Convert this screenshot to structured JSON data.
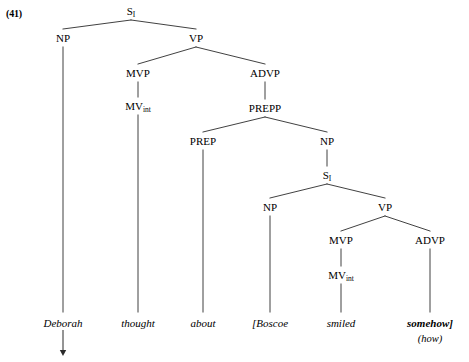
{
  "figure": {
    "example_number": "(41)",
    "background_color": "#ffffff",
    "line_color": "#2b2b2b",
    "text_color": "#000000"
  },
  "tree": {
    "nodes": [
      {
        "id": "s-root",
        "label": "S",
        "subscript": "I",
        "x": 131,
        "y": 6
      },
      {
        "id": "np-matrix",
        "label": "NP",
        "subscript": "",
        "x": 63,
        "y": 33
      },
      {
        "id": "vp-matrix",
        "label": "VP",
        "subscript": "",
        "x": 196,
        "y": 33
      },
      {
        "id": "mvp-matrix",
        "label": "MVP",
        "subscript": "",
        "x": 138,
        "y": 68
      },
      {
        "id": "advp-matrix",
        "label": "ADVP",
        "subscript": "",
        "x": 265,
        "y": 68
      },
      {
        "id": "mvint-matrix",
        "label": "MV",
        "subscript": "int",
        "x": 138,
        "y": 101
      },
      {
        "id": "prepp",
        "label": "PREPP",
        "subscript": "",
        "x": 265,
        "y": 103
      },
      {
        "id": "prep",
        "label": "PREP",
        "subscript": "",
        "x": 203,
        "y": 136
      },
      {
        "id": "np-embed-top",
        "label": "NP",
        "subscript": "",
        "x": 327,
        "y": 136
      },
      {
        "id": "s-embed",
        "label": "S",
        "subscript": "I",
        "x": 327,
        "y": 170
      },
      {
        "id": "np-embed",
        "label": "NP",
        "subscript": "",
        "x": 270,
        "y": 202
      },
      {
        "id": "vp-embed",
        "label": "VP",
        "subscript": "",
        "x": 385,
        "y": 202
      },
      {
        "id": "mvp-embed",
        "label": "MVP",
        "subscript": "",
        "x": 341,
        "y": 235
      },
      {
        "id": "advp-embed",
        "label": "ADVP",
        "subscript": "",
        "x": 430,
        "y": 235
      },
      {
        "id": "mvint-embed",
        "label": "MV",
        "subscript": "int",
        "x": 341,
        "y": 270
      }
    ],
    "edges": [
      {
        "id": "e-root-np",
        "x1": 131,
        "y1": 20,
        "x2": 63,
        "y2": 29
      },
      {
        "id": "e-root-vp",
        "x1": 131,
        "y1": 20,
        "x2": 196,
        "y2": 29
      },
      {
        "id": "e-vp-mvp",
        "x1": 196,
        "y1": 47,
        "x2": 138,
        "y2": 64
      },
      {
        "id": "e-vp-advp",
        "x1": 196,
        "y1": 47,
        "x2": 265,
        "y2": 64
      },
      {
        "id": "e-mvp-mvint",
        "x1": 138,
        "y1": 82,
        "x2": 138,
        "y2": 97
      },
      {
        "id": "e-advp-prepp",
        "x1": 265,
        "y1": 82,
        "x2": 265,
        "y2": 99
      },
      {
        "id": "e-prepp-prep",
        "x1": 265,
        "y1": 117,
        "x2": 203,
        "y2": 132
      },
      {
        "id": "e-prepp-np",
        "x1": 265,
        "y1": 117,
        "x2": 327,
        "y2": 132
      },
      {
        "id": "e-np-sembed",
        "x1": 327,
        "y1": 150,
        "x2": 327,
        "y2": 166
      },
      {
        "id": "e-sembed-np",
        "x1": 327,
        "y1": 184,
        "x2": 270,
        "y2": 198
      },
      {
        "id": "e-sembed-vp",
        "x1": 327,
        "y1": 184,
        "x2": 385,
        "y2": 198
      },
      {
        "id": "e-vpembed-mvp",
        "x1": 385,
        "y1": 216,
        "x2": 341,
        "y2": 231
      },
      {
        "id": "e-vpembed-advp",
        "x1": 385,
        "y1": 216,
        "x2": 430,
        "y2": 231
      },
      {
        "id": "e-mvpembed-mvint",
        "x1": 341,
        "y1": 249,
        "x2": 341,
        "y2": 266
      },
      {
        "id": "e-np-deborah",
        "x1": 63,
        "y1": 47,
        "x2": 63,
        "y2": 312
      },
      {
        "id": "e-mvint-thought",
        "x1": 138,
        "y1": 115,
        "x2": 138,
        "y2": 312
      },
      {
        "id": "e-prep-about",
        "x1": 203,
        "y1": 150,
        "x2": 203,
        "y2": 312
      },
      {
        "id": "e-npembed-boscoe",
        "x1": 270,
        "y1": 216,
        "x2": 270,
        "y2": 312
      },
      {
        "id": "e-mvint-smiled",
        "x1": 341,
        "y1": 284,
        "x2": 341,
        "y2": 312
      },
      {
        "id": "e-advp-somehow",
        "x1": 430,
        "y1": 249,
        "x2": 430,
        "y2": 312
      }
    ],
    "terminals": [
      {
        "id": "t-deborah",
        "text": "Deborah",
        "x": 63,
        "y": 318,
        "bold": false
      },
      {
        "id": "t-thought",
        "text": "thought",
        "x": 138,
        "y": 318,
        "bold": false
      },
      {
        "id": "t-about",
        "text": "about",
        "x": 203,
        "y": 318,
        "bold": false
      },
      {
        "id": "t-boscoe",
        "text": "[Boscoe",
        "x": 270,
        "y": 318,
        "bold": false
      },
      {
        "id": "t-smiled",
        "text": "smiled",
        "x": 341,
        "y": 318,
        "bold": false
      },
      {
        "id": "t-somehow",
        "text": "somehow]",
        "x": 430,
        "y": 318,
        "bold": true
      }
    ],
    "gloss": {
      "id": "gloss-how",
      "text": "(how)",
      "x": 430,
      "y": 334
    },
    "movement_arrow": {
      "id": "arrow-deborah",
      "x": 63,
      "y_start": 330,
      "y_end": 356
    }
  }
}
